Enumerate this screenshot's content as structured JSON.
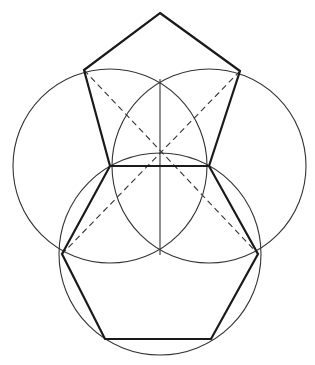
{
  "diagram": {
    "type": "geometric-construction",
    "colors": {
      "background": "#ffffff",
      "stroke": "#1a1a1a",
      "thin_stroke": "#333333"
    },
    "circles": [
      {
        "name": "left-circle",
        "cx": 110,
        "cy": 166,
        "r": 97
      },
      {
        "name": "right-circle",
        "cx": 209,
        "cy": 166,
        "r": 97
      },
      {
        "name": "bottom-circle",
        "cx": 160,
        "cy": 254,
        "r": 101
      }
    ],
    "pentagon": [
      [
        160,
        13
      ],
      [
        240,
        71
      ],
      [
        209,
        166
      ],
      [
        110,
        166
      ],
      [
        84,
        70
      ]
    ],
    "hexagon": [
      [
        110,
        166
      ],
      [
        209,
        166
      ],
      [
        258,
        254
      ],
      [
        211,
        339
      ],
      [
        105,
        339
      ],
      [
        62,
        254
      ]
    ],
    "dashed_lines": [
      {
        "name": "diagonal-left-to-right",
        "x1": 84,
        "y1": 70,
        "x2": 258,
        "y2": 254
      },
      {
        "name": "diagonal-right-to-left",
        "x1": 240,
        "y1": 71,
        "x2": 62,
        "y2": 254
      }
    ],
    "axis_line": {
      "x1": 160,
      "y1": 79,
      "x2": 160,
      "y2": 255
    }
  }
}
